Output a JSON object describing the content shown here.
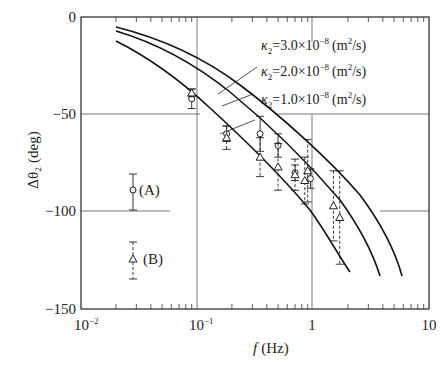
{
  "chart_data": {
    "type": "scatter",
    "title": "",
    "xlabel": "f (Hz)",
    "ylabel": "Δθ2 (deg)",
    "xscale": "log",
    "xlim": [
      0.01,
      10
    ],
    "ylim": [
      -150,
      0
    ],
    "x_ticks": [
      "10^-2",
      "10^-1",
      "1",
      "10"
    ],
    "y_ticks": [
      "0",
      "-50",
      "-100",
      "-150"
    ],
    "grid": "major gridlines at f=0.1, f=1, y=-50, y=-100",
    "legend": [
      {
        "marker": "circle",
        "errorbar": "solid",
        "label": "(A)"
      },
      {
        "marker": "triangle",
        "errorbar": "dashed",
        "label": "(B)"
      }
    ],
    "curves": [
      {
        "name": "κ2=3.0×10^-8 (m²/s)",
        "x": [
          0.02,
          0.05,
          0.1,
          0.2,
          0.5,
          1,
          2,
          3,
          5.3
        ],
        "y": [
          -6,
          -17,
          -30,
          -45,
          -65,
          -80,
          -100,
          -115,
          -134
        ]
      },
      {
        "name": "κ2=2.0×10^-8 (m²/s)",
        "x": [
          0.02,
          0.05,
          0.1,
          0.2,
          0.5,
          1,
          2,
          3,
          4
        ],
        "y": [
          -8,
          -20,
          -34,
          -50,
          -70,
          -87,
          -107,
          -122,
          -132
        ]
      },
      {
        "name": "κ2=1.0×10^-8 (m²/s)",
        "x": [
          0.02,
          0.05,
          0.1,
          0.2,
          0.5,
          1,
          1.5,
          2
        ],
        "y": [
          -14,
          -28,
          -44,
          -60,
          -80,
          -98,
          -115,
          -126
        ]
      }
    ],
    "series": [
      {
        "name": "(A)",
        "marker": "circle",
        "x": [
          0.09,
          0.18,
          0.35,
          0.5,
          0.7,
          0.95
        ],
        "y": [
          -42,
          -60,
          -60,
          -66,
          -80,
          -83
        ],
        "yerr": [
          5,
          4,
          9,
          6,
          4,
          5
        ]
      },
      {
        "name": "(B)",
        "marker": "triangle",
        "x": [
          0.09,
          0.18,
          0.35,
          0.5,
          0.7,
          0.9,
          0.85,
          1.5,
          1.7
        ],
        "y": [
          -39,
          -62,
          -72,
          -77,
          -81,
          -79,
          -84,
          -97,
          -103
        ],
        "yerr": [
          2,
          6,
          10,
          12,
          8,
          16,
          12,
          18,
          24
        ]
      }
    ],
    "annotations": [
      "κ2=3.0×10^-8 (m²/s)",
      "κ2=2.0×10^-8 (m²/s)",
      "κ2=1.0×10^-8 (m²/s)"
    ]
  },
  "axes": {
    "xlabel_italic": "f",
    "xlabel_unit": "(Hz)",
    "ylabel": "Δθ₂ (deg)",
    "xticks": [
      {
        "base": "10",
        "exp": "−2"
      },
      {
        "base": "10",
        "exp": "−1"
      },
      {
        "base": "1",
        "exp": ""
      },
      {
        "base": "10",
        "exp": ""
      }
    ],
    "yticks": [
      "0",
      "−50",
      "−100",
      "−150"
    ]
  },
  "legend": {
    "a_label": "(A)",
    "b_label": "(B)"
  },
  "annotations": {
    "k3": {
      "sym": "κ",
      "sub": "2",
      "eq": "=3.0×10",
      "exp": "−8",
      "unit_a": "(m",
      "unit_exp": "2",
      "unit_b": "/s)"
    },
    "k2": {
      "sym": "κ",
      "sub": "2",
      "eq": "=2.0×10",
      "exp": "−8",
      "unit_a": "(m",
      "unit_exp": "2",
      "unit_b": "/s)"
    },
    "k1": {
      "sym": "κ",
      "sub": "2",
      "eq": "=1.0×10",
      "exp": "−8",
      "unit_a": "(m",
      "unit_exp": "2",
      "unit_b": "/s)"
    }
  }
}
